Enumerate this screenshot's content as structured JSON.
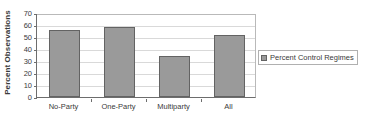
{
  "chart_data": {
    "type": "bar",
    "title": "",
    "subtitle": "",
    "xlabel": "",
    "ylabel": "Percent Observations",
    "categories": [
      "No-Party",
      "One-Party",
      "Multiparty",
      "All"
    ],
    "values": [
      56,
      58,
      34.5,
      51.5
    ],
    "series": [
      {
        "name": "Percent Control Regimes",
        "values": [
          56,
          58,
          34.5,
          51.5
        ],
        "color": "#9a9a9a"
      }
    ],
    "ylim": [
      0,
      70
    ],
    "ytick_step": 10,
    "yticks": [
      70,
      60,
      50,
      40,
      30,
      20,
      10,
      0
    ],
    "grid": true,
    "grid_axis": "y",
    "legend": [
      "Percent Control Regimes"
    ],
    "legend_position": "right"
  },
  "colors": {
    "bar_fill": "#9a9a9a",
    "bar_border": "#636363",
    "gridline": "#d9d9d9",
    "axis": "#6d6d6d",
    "plot_border": "#b9b9b9",
    "text": "#3a3a3a",
    "background": "#ffffff",
    "legend_border": "#b0b0b0"
  },
  "legend": {
    "label": "Percent Control Regimes",
    "swatch_name": "legend-color-swatch"
  }
}
